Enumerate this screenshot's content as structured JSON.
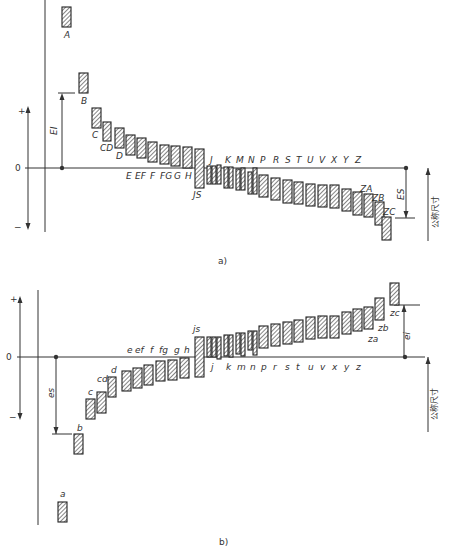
{
  "diagram": {
    "part_a": {
      "caption": "a)",
      "zero_label": "0",
      "plus_label": "+",
      "minus_label": "−",
      "lower_dev_label": "EI",
      "upper_dev_label": "ES",
      "nominal_size_label": "公称尺寸",
      "zero_y": 168,
      "bars": [
        {
          "id": "A",
          "x": 62,
          "top": 7,
          "bottom": 27,
          "w": 9,
          "label": "A",
          "lx": 64,
          "ly": 38
        },
        {
          "id": "B",
          "x": 79,
          "top": 73,
          "bottom": 93,
          "w": 9,
          "label": "B",
          "lx": 81,
          "ly": 104
        },
        {
          "id": "C",
          "x": 92,
          "top": 108,
          "bottom": 128,
          "w": 9,
          "label": "C",
          "lx": 92,
          "ly": 138
        },
        {
          "id": "CD",
          "x": 103,
          "top": 122,
          "bottom": 141,
          "w": 8,
          "label": "CD",
          "lx": 100,
          "ly": 151
        },
        {
          "id": "D",
          "x": 115,
          "top": 128,
          "bottom": 148,
          "w": 9,
          "label": "D",
          "lx": 116,
          "ly": 159
        },
        {
          "id": "E",
          "x": 126,
          "top": 135,
          "bottom": 155,
          "w": 9
        },
        {
          "id": "EF",
          "x": 137,
          "top": 138,
          "bottom": 158,
          "w": 9
        },
        {
          "id": "F",
          "x": 148,
          "top": 142,
          "bottom": 162,
          "w": 9
        },
        {
          "id": "FG",
          "x": 160,
          "top": 145,
          "bottom": 164,
          "w": 9
        },
        {
          "id": "G",
          "x": 171,
          "top": 146,
          "bottom": 166,
          "w": 9
        },
        {
          "id": "H",
          "x": 183,
          "top": 147,
          "bottom": 168,
          "w": 9
        },
        {
          "id": "JS",
          "x": 195,
          "top": 149,
          "bottom": 188,
          "w": 9,
          "label": "JS",
          "lx": 193,
          "ly": 198
        },
        {
          "id": "J1",
          "x": 207,
          "top": 166,
          "bottom": 184,
          "w": 4
        },
        {
          "id": "J2",
          "x": 212,
          "top": 166,
          "bottom": 184,
          "w": 4
        },
        {
          "id": "J3",
          "x": 217,
          "top": 165,
          "bottom": 184,
          "w": 4
        },
        {
          "id": "K1",
          "x": 224,
          "top": 167,
          "bottom": 188,
          "w": 4
        },
        {
          "id": "K2",
          "x": 229,
          "top": 167,
          "bottom": 188,
          "w": 4
        },
        {
          "id": "M1",
          "x": 236,
          "top": 169,
          "bottom": 190,
          "w": 4
        },
        {
          "id": "M2",
          "x": 241,
          "top": 168,
          "bottom": 190,
          "w": 4
        },
        {
          "id": "N1",
          "x": 248,
          "top": 172,
          "bottom": 194,
          "w": 4
        },
        {
          "id": "N2",
          "x": 253,
          "top": 168,
          "bottom": 194,
          "w": 4
        },
        {
          "id": "P",
          "x": 259,
          "top": 175,
          "bottom": 197,
          "w": 9
        },
        {
          "id": "R",
          "x": 271,
          "top": 178,
          "bottom": 200,
          "w": 9
        },
        {
          "id": "S",
          "x": 283,
          "top": 180,
          "bottom": 203,
          "w": 9
        },
        {
          "id": "T",
          "x": 294,
          "top": 182,
          "bottom": 204,
          "w": 9
        },
        {
          "id": "U",
          "x": 306,
          "top": 184,
          "bottom": 206,
          "w": 9
        },
        {
          "id": "V",
          "x": 318,
          "top": 185,
          "bottom": 207,
          "w": 9
        },
        {
          "id": "X",
          "x": 330,
          "top": 185,
          "bottom": 208,
          "w": 9
        },
        {
          "id": "Y",
          "x": 342,
          "top": 189,
          "bottom": 211,
          "w": 9
        },
        {
          "id": "Z",
          "x": 353,
          "top": 192,
          "bottom": 215,
          "w": 9
        },
        {
          "id": "ZA",
          "x": 364,
          "top": 194,
          "bottom": 217,
          "w": 9,
          "label": "ZA",
          "lx": 360,
          "ly": 192
        },
        {
          "id": "ZB",
          "x": 375,
          "top": 202,
          "bottom": 225,
          "w": 9,
          "label": "ZB",
          "lx": 372,
          "ly": 201
        },
        {
          "id": "ZC",
          "x": 382,
          "top": 217,
          "bottom": 240,
          "w": 9,
          "label": "ZC",
          "lx": 383,
          "ly": 215
        }
      ],
      "row_labels": [
        {
          "t": "E",
          "x": 126,
          "y": 179
        },
        {
          "t": "EF",
          "x": 135,
          "y": 179
        },
        {
          "t": "F",
          "x": 150,
          "y": 179
        },
        {
          "t": "FG",
          "x": 160,
          "y": 179
        },
        {
          "t": "G",
          "x": 174,
          "y": 179
        },
        {
          "t": "H",
          "x": 185,
          "y": 179
        },
        {
          "t": "J",
          "x": 210,
          "y": 163
        },
        {
          "t": "K",
          "x": 225,
          "y": 163
        },
        {
          "t": "M",
          "x": 236,
          "y": 163
        },
        {
          "t": "N",
          "x": 248,
          "y": 163
        },
        {
          "t": "P",
          "x": 260,
          "y": 163
        },
        {
          "t": "R",
          "x": 273,
          "y": 163
        },
        {
          "t": "S",
          "x": 285,
          "y": 163
        },
        {
          "t": "T",
          "x": 296,
          "y": 163
        },
        {
          "t": "U",
          "x": 307,
          "y": 163
        },
        {
          "t": "V",
          "x": 319,
          "y": 163
        },
        {
          "t": "X",
          "x": 331,
          "y": 163
        },
        {
          "t": "Y",
          "x": 343,
          "y": 163
        },
        {
          "t": "Z",
          "x": 355,
          "y": 163
        }
      ]
    },
    "part_b": {
      "caption": "b)",
      "zero_label": "0",
      "plus_label": "+",
      "minus_label": "−",
      "lower_dev_label": "ei",
      "upper_dev_label": "es",
      "nominal_size_label": "公称尺寸",
      "zero_y": 357,
      "bars": [
        {
          "id": "a",
          "x": 58,
          "top": 502,
          "bottom": 522,
          "w": 9,
          "label": "a",
          "lx": 60,
          "ly": 497
        },
        {
          "id": "b",
          "x": 74,
          "top": 434,
          "bottom": 454,
          "w": 9,
          "label": "b",
          "lx": 77,
          "ly": 431
        },
        {
          "id": "c",
          "x": 86,
          "top": 399,
          "bottom": 419,
          "w": 9,
          "label": "c",
          "lx": 88,
          "ly": 395
        },
        {
          "id": "cd",
          "x": 97,
          "top": 392,
          "bottom": 413,
          "w": 9,
          "label": "cd",
          "lx": 97,
          "ly": 382
        },
        {
          "id": "d",
          "x": 108,
          "top": 377,
          "bottom": 397,
          "w": 8,
          "label": "d",
          "lx": 111,
          "ly": 373
        },
        {
          "id": "e",
          "x": 122,
          "top": 371,
          "bottom": 391,
          "w": 9
        },
        {
          "id": "ef",
          "x": 133,
          "top": 368,
          "bottom": 388,
          "w": 9
        },
        {
          "id": "f",
          "x": 144,
          "top": 365,
          "bottom": 385,
          "w": 9
        },
        {
          "id": "fg",
          "x": 156,
          "top": 361,
          "bottom": 381,
          "w": 9
        },
        {
          "id": "g",
          "x": 168,
          "top": 360,
          "bottom": 380,
          "w": 9
        },
        {
          "id": "h",
          "x": 180,
          "top": 358,
          "bottom": 378,
          "w": 9
        },
        {
          "id": "js",
          "x": 195,
          "top": 337,
          "bottom": 377,
          "w": 9,
          "label": "js",
          "lx": 193,
          "ly": 332
        },
        {
          "id": "j1",
          "x": 207,
          "top": 337,
          "bottom": 357,
          "w": 4
        },
        {
          "id": "j2",
          "x": 212,
          "top": 337,
          "bottom": 357,
          "w": 4
        },
        {
          "id": "j3",
          "x": 217,
          "top": 337,
          "bottom": 359,
          "w": 4
        },
        {
          "id": "k1",
          "x": 224,
          "top": 335,
          "bottom": 356,
          "w": 4
        },
        {
          "id": "k2",
          "x": 229,
          "top": 335,
          "bottom": 357,
          "w": 4
        },
        {
          "id": "m1",
          "x": 236,
          "top": 333,
          "bottom": 354,
          "w": 4
        },
        {
          "id": "m2",
          "x": 241,
          "top": 333,
          "bottom": 356,
          "w": 4
        },
        {
          "id": "n1",
          "x": 248,
          "top": 331,
          "bottom": 350,
          "w": 4
        },
        {
          "id": "n2",
          "x": 253,
          "top": 331,
          "bottom": 355,
          "w": 4
        },
        {
          "id": "p",
          "x": 259,
          "top": 326,
          "bottom": 348,
          "w": 9
        },
        {
          "id": "r",
          "x": 271,
          "top": 324,
          "bottom": 346,
          "w": 9
        },
        {
          "id": "s",
          "x": 283,
          "top": 322,
          "bottom": 344,
          "w": 9
        },
        {
          "id": "t",
          "x": 294,
          "top": 320,
          "bottom": 342,
          "w": 9
        },
        {
          "id": "u",
          "x": 306,
          "top": 317,
          "bottom": 339,
          "w": 9
        },
        {
          "id": "v",
          "x": 318,
          "top": 316,
          "bottom": 338,
          "w": 9
        },
        {
          "id": "x",
          "x": 330,
          "top": 316,
          "bottom": 338,
          "w": 9
        },
        {
          "id": "y",
          "x": 342,
          "top": 312,
          "bottom": 334,
          "w": 9
        },
        {
          "id": "z",
          "x": 353,
          "top": 309,
          "bottom": 331,
          "w": 9
        },
        {
          "id": "za",
          "x": 364,
          "top": 307,
          "bottom": 329,
          "w": 9,
          "label": "za",
          "lx": 368,
          "ly": 342
        },
        {
          "id": "zb",
          "x": 375,
          "top": 298,
          "bottom": 320,
          "w": 9,
          "label": "zb",
          "lx": 378,
          "ly": 331
        },
        {
          "id": "zc",
          "x": 390,
          "top": 283,
          "bottom": 305,
          "w": 9,
          "label": "zc",
          "lx": 390,
          "ly": 316
        }
      ],
      "row_labels": [
        {
          "t": "e",
          "x": 127,
          "y": 353
        },
        {
          "t": "ef",
          "x": 135,
          "y": 353
        },
        {
          "t": "f",
          "x": 150,
          "y": 353
        },
        {
          "t": "fg",
          "x": 159,
          "y": 353
        },
        {
          "t": "g",
          "x": 174,
          "y": 353
        },
        {
          "t": "h",
          "x": 184,
          "y": 353
        },
        {
          "t": "j",
          "x": 211,
          "y": 370
        },
        {
          "t": "k",
          "x": 226,
          "y": 370
        },
        {
          "t": "m",
          "x": 237,
          "y": 370
        },
        {
          "t": "n",
          "x": 250,
          "y": 370
        },
        {
          "t": "p",
          "x": 261,
          "y": 370
        },
        {
          "t": "r",
          "x": 273,
          "y": 370
        },
        {
          "t": "s",
          "x": 285,
          "y": 370
        },
        {
          "t": "t",
          "x": 296,
          "y": 370
        },
        {
          "t": "u",
          "x": 308,
          "y": 370
        },
        {
          "t": "v",
          "x": 320,
          "y": 370
        },
        {
          "t": "x",
          "x": 332,
          "y": 370
        },
        {
          "t": "y",
          "x": 344,
          "y": 370
        },
        {
          "t": "z",
          "x": 356,
          "y": 370
        }
      ]
    }
  }
}
